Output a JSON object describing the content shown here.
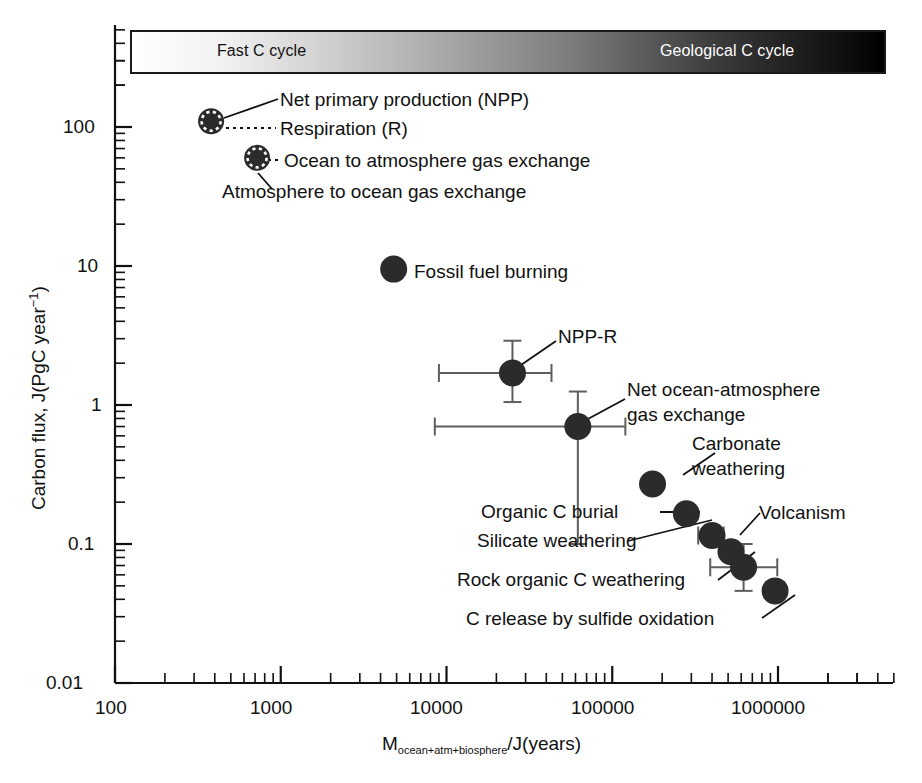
{
  "chart_data": {
    "type": "scatter",
    "title": "",
    "xlabel": "M(ocean+atm+biosphere)/J(years)",
    "xlabel_main": "M",
    "xlabel_sub": "ocean+atm+biosphere",
    "xlabel_tail": "/J(years)",
    "ylabel": "Carbon flux, J(PgC year-1)",
    "ylabel_main": "Carbon flux, J(PgC year",
    "ylabel_sup": "-1",
    "ylabel_tail": ")",
    "xscale": "log",
    "yscale": "log",
    "xlim": [
      100,
      4000000
    ],
    "ylim": [
      0.01,
      300
    ],
    "xticks": [
      "100",
      "1000",
      "10000",
      "100000",
      "1000000"
    ],
    "xtick_values": [
      100,
      1000,
      10000,
      100000,
      1000000
    ],
    "yticks": [
      "0.01",
      "0.1",
      "1",
      "10",
      "100"
    ],
    "ytick_values": [
      0.01,
      0.1,
      1,
      10,
      100
    ],
    "grid": false,
    "legend": "none",
    "marker_color": "#2b2b2b",
    "errorbar_color": "#5e5e5e",
    "points": [
      {
        "name": "Net primary production (NPP)",
        "x": 380,
        "y": 110,
        "marker": "dashed-outline",
        "label": "Net primary production (NPP)",
        "xerr": null,
        "yerr": null
      },
      {
        "name": "Respiration (R)",
        "x": 380,
        "y": 110,
        "marker": "dashed-outline",
        "label": "Respiration (R)",
        "xerr": null,
        "yerr": null
      },
      {
        "name": "Ocean to atmosphere gas exchange",
        "x": 720,
        "y": 60,
        "marker": "dashed-outline",
        "label": "Ocean to atmosphere gas exchange",
        "xerr": null,
        "yerr": null
      },
      {
        "name": "Atmosphere to ocean gas exchange",
        "x": 720,
        "y": 60,
        "marker": "dashed-outline",
        "label": "Atmosphere to ocean gas exchange",
        "xerr": null,
        "yerr": null
      },
      {
        "name": "Fossil fuel burning",
        "x": 4800,
        "y": 9.5,
        "marker": "solid",
        "label": "Fossil fuel burning",
        "xerr": null,
        "yerr": null
      },
      {
        "name": "NPP-R",
        "x": 25000,
        "y": 1.7,
        "marker": "solid",
        "label": "NPP-R",
        "xerr": [
          9000,
          43000
        ],
        "yerr": [
          1.05,
          2.9
        ]
      },
      {
        "name": "Net ocean-atmosphere gas exchange",
        "x": 62000,
        "y": 0.7,
        "marker": "solid",
        "label": "Net ocean-atmosphere gas exchange",
        "xerr": [
          8500,
          120000
        ],
        "yerr": [
          0.1,
          1.25
        ]
      },
      {
        "name": "Carbonate weathering",
        "x": 175000,
        "y": 0.27,
        "marker": "solid",
        "label": "Carbonate weathering",
        "xerr": null,
        "yerr": null
      },
      {
        "name": "Organic C burial",
        "x": 280000,
        "y": 0.165,
        "marker": "solid",
        "label": "Organic C burial",
        "xerr": null,
        "yerr": null
      },
      {
        "name": "Silicate weathering",
        "x": 400000,
        "y": 0.115,
        "marker": "solid",
        "label": "Silicate weathering",
        "xerr": [
          330000,
          470000
        ],
        "yerr": null
      },
      {
        "name": "Volcanism",
        "x": 520000,
        "y": 0.088,
        "marker": "solid",
        "label": "Volcanism",
        "xerr": null,
        "yerr": null
      },
      {
        "name": "Rock organic C weathering",
        "x": 620000,
        "y": 0.068,
        "marker": "solid",
        "label": "Rock organic C weathering",
        "xerr": [
          390000,
          990000
        ],
        "yerr": [
          0.046,
          0.1
        ]
      },
      {
        "name": "C release by sulfide oxidation",
        "x": 960000,
        "y": 0.046,
        "marker": "solid",
        "label": "C release by sulfide oxidation",
        "xerr": null,
        "yerr": null
      }
    ],
    "annotations": {
      "gradient_bar": {
        "left_label": "Fast C cycle",
        "right_label": "Geological C cycle",
        "from_color": "#ffffff",
        "to_color": "#000000"
      }
    }
  },
  "axis": {
    "y_tick_labels": [
      "100",
      "10",
      "1",
      "0.1",
      "0.01"
    ],
    "x_tick_labels": [
      "100",
      "1000",
      "10000",
      "100000",
      "1000000"
    ]
  },
  "labels": {
    "npp": "Net primary production (NPP)",
    "respiration": "Respiration (R)",
    "ocean_to_atm": "Ocean to atmosphere gas exchange",
    "atm_to_ocean": "Atmosphere to ocean gas exchange",
    "fossil": "Fossil fuel burning",
    "npp_r": "NPP-R",
    "net_ocean_atm_1": "Net ocean-atmosphere",
    "net_ocean_atm_2": "gas exchange",
    "carbonate_1": "Carbonate",
    "carbonate_2": "weathering",
    "organic_burial": "Organic C burial",
    "silicate": "Silicate weathering",
    "volcanism": "Volcanism",
    "rock_organic": "Rock organic C weathering",
    "sulfide": "C release by sulfide oxidation"
  },
  "gradient_bar": {
    "fast": "Fast C cycle",
    "geological": "Geological C cycle"
  },
  "axis_titles": {
    "y_main": "Carbon flux, J(PgC year",
    "y_sup": "−1",
    "y_tail": ")",
    "x_main": "M",
    "x_sub": "ocean+atm+biosphere",
    "x_tail": "/J(years)"
  }
}
